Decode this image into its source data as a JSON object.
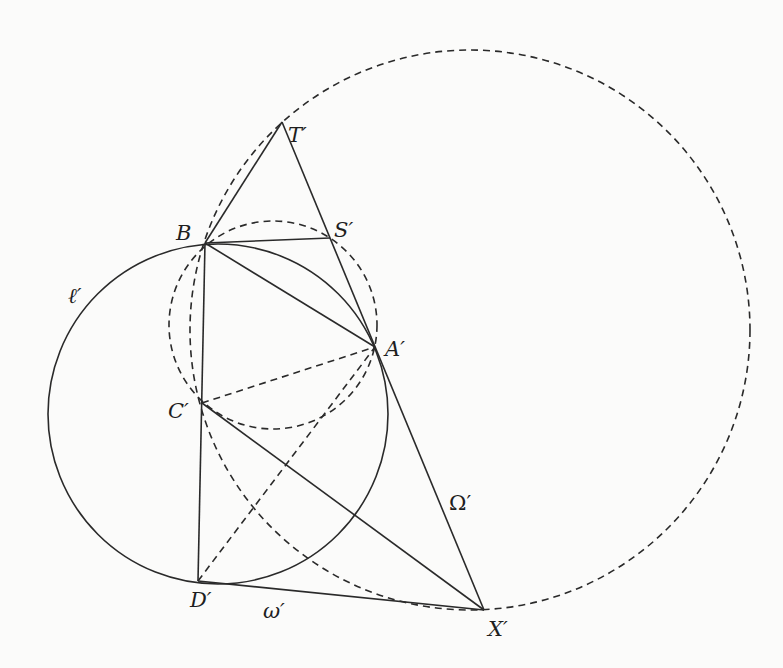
{
  "figure": {
    "points": {
      "T": {
        "label": "T′",
        "x": 282,
        "y": 122
      },
      "B": {
        "label": "B",
        "x": 205,
        "y": 243
      },
      "S": {
        "label": "S′",
        "x": 330,
        "y": 238
      },
      "A": {
        "label": "A′",
        "x": 375,
        "y": 347
      },
      "C": {
        "label": "C′",
        "x": 202,
        "y": 403
      },
      "D": {
        "label": "D′",
        "x": 198,
        "y": 581
      },
      "X": {
        "label": "X′",
        "x": 484,
        "y": 610
      }
    },
    "circles": {
      "ell": {
        "label": "ℓ′",
        "cx": 218,
        "cy": 414,
        "r": 170,
        "style": "solid"
      },
      "Omega": {
        "label": "Ω′",
        "cx": 470,
        "cy": 330,
        "r": 280,
        "style": "dashed"
      },
      "aux": {
        "label": "",
        "cx": 273,
        "cy": 325,
        "r": 104,
        "style": "dashed"
      }
    },
    "curve_labels": {
      "ell": "ℓ′",
      "Omega": "Ω′",
      "omega": "ω′"
    },
    "solid_segments": [
      [
        "T",
        "B"
      ],
      [
        "T",
        "X"
      ],
      [
        "B",
        "S"
      ],
      [
        "B",
        "A"
      ],
      [
        "B",
        "D"
      ],
      [
        "C",
        "X"
      ],
      [
        "D",
        "X"
      ]
    ],
    "dashed_segments": [
      [
        "C",
        "A"
      ],
      [
        "D",
        "A"
      ]
    ]
  }
}
